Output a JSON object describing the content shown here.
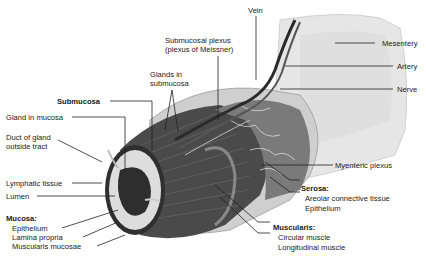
{
  "diagram": {
    "labels": {
      "vein": "Vein",
      "submucosal_plexus_1": "Submucosal plexus",
      "submucosal_plexus_2": "(plexus of Meissner)",
      "mesentery": "Mesentery",
      "artery": "Artery",
      "nerve": "Nerve",
      "glands_submucosa_1": "Glands in",
      "glands_submucosa_2": "submucosa",
      "submucosa": "Submucosa",
      "gland_in_mucosa": "Gland in mucosa",
      "duct_1": "Duct of gland",
      "duct_2": "outside tract",
      "lymphatic_tissue": "Lymphatic tissue",
      "lumen": "Lumen",
      "mucosa_heading": "Mucosa:",
      "mucosa_epithelium": "Epithelium",
      "lamina_propria": "Lamina propria",
      "muscularis_mucosae": "Muscularis mucosae",
      "myenteric_plexus": "Myenteric plexus",
      "serosa_heading": "Serosa:",
      "areolar": "Areolar connective tissue",
      "serosa_epithelium": "Epithelium",
      "muscularis_heading": "Muscularis:",
      "circular_muscle": "Circular muscle",
      "longitudinal_muscle": "Longitudinal muscle"
    },
    "colors": {
      "background": "#ffffff",
      "text": "#1a1a1a",
      "leader": "#222222",
      "mesentery": "#e4e4e4",
      "serosa": "#d2d2d2",
      "muscle_dark": "#3a3a3a",
      "muscle_mid": "#5a5a5a",
      "mucosa_ring": "#dcdcdc",
      "lumen": "#2e2e2e"
    }
  }
}
